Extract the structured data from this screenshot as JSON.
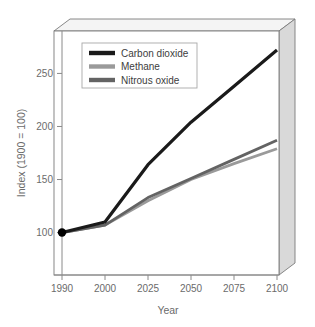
{
  "chart_data": {
    "type": "line",
    "title": "",
    "xlabel": "Year",
    "ylabel": "Index (1900 = 100)",
    "x": [
      "1990",
      "2000",
      "2025",
      "2050",
      "2075",
      "2100"
    ],
    "xtick_labels": [
      "1990",
      "2000",
      "2025",
      "2050",
      "2075",
      "2100"
    ],
    "ytick_labels": [
      "100",
      "150",
      "200",
      "250"
    ],
    "yticks": [
      100,
      150,
      200,
      250
    ],
    "ylim": [
      60,
      290
    ],
    "grid": false,
    "legend_position": "upper-left-inside",
    "series": [
      {
        "name": "Carbon dioxide",
        "color": "#1a1a1a",
        "values": [
          100,
          110,
          164,
          204,
          238,
          272
        ]
      },
      {
        "name": "Methane",
        "color": "#9a9a9a",
        "values": [
          100,
          107,
          130,
          150,
          165,
          179
        ]
      },
      {
        "name": "Nitrous oxide",
        "color": "#636363",
        "values": [
          100,
          107,
          133,
          151,
          169,
          187
        ]
      }
    ],
    "markers": [
      {
        "label": "start-point",
        "x": "1990",
        "y": 100,
        "color": "#000000"
      }
    ],
    "style": {
      "panel_3d": true,
      "frame_color": "#6e6e6e",
      "panel_side_color": "#d8d8d8",
      "panel_top_color": "#f2f2f2",
      "legend_border_color": "#a8a8a8",
      "legend_background": "#ffffff",
      "text_color": "#6b6b6b"
    }
  },
  "legend": {
    "items": [
      {
        "label": "Carbon dioxide"
      },
      {
        "label": "Methane"
      },
      {
        "label": "Nitrous oxide"
      }
    ]
  },
  "axes": {
    "x_title": "Year",
    "y_title": "Index (1900 = 100)"
  }
}
